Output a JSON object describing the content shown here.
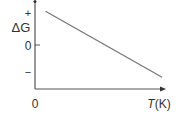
{
  "chart_data": {
    "type": "line",
    "title": "",
    "xlabel": "T(K)",
    "ylabel": "ΔG",
    "x_origin_label": "0",
    "y_tick_labels": {
      "positive": "+",
      "zero": "0",
      "negative": "−"
    },
    "series": [
      {
        "name": "ΔG vs T",
        "x": [
          0.08,
          0.97
        ],
        "y": [
          0.92,
          -0.95
        ]
      }
    ],
    "xlim": [
      0,
      1
    ],
    "ylim": [
      -1.3,
      1.2
    ],
    "grid": false,
    "legend": "none",
    "colors": {
      "axis": "#555555",
      "line": "#777777",
      "text": "#333333"
    }
  }
}
